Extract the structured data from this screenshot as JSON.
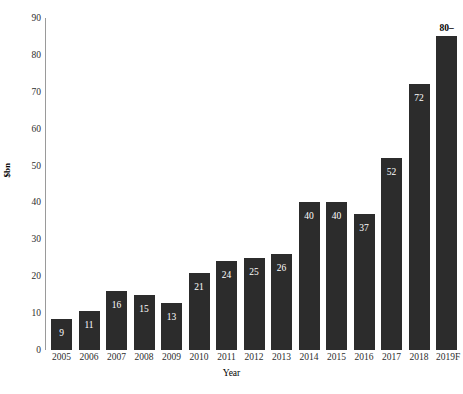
{
  "chart_data": {
    "type": "bar",
    "title": "",
    "xlabel": "Year",
    "ylabel": "$bn",
    "categories": [
      "2005",
      "2006",
      "2007",
      "2008",
      "2009",
      "2010",
      "2011",
      "2012",
      "2013",
      "2014",
      "2015",
      "2016",
      "2017",
      "2018",
      "2019F"
    ],
    "values": [
      8.5,
      10.5,
      16,
      15,
      12.7,
      21,
      24,
      25,
      26,
      40,
      40,
      37,
      52,
      72,
      85
    ],
    "labels": [
      "9",
      "11",
      "16",
      "15",
      "13",
      "21",
      "24",
      "25",
      "26",
      "40",
      "40",
      "37",
      "52",
      "72",
      "80–"
    ],
    "label_positions": [
      "inside",
      "inside",
      "inside",
      "inside",
      "inside",
      "inside",
      "inside",
      "inside",
      "inside",
      "inside",
      "inside",
      "inside",
      "inside",
      "inside",
      "above"
    ],
    "ylim": [
      0,
      90
    ],
    "yticks": [
      0,
      10,
      20,
      30,
      40,
      50,
      60,
      70,
      80,
      90
    ],
    "ytick_labels": [
      "0",
      "10",
      "20",
      "30",
      "40",
      "50",
      "60",
      "70",
      "80",
      "90"
    ],
    "grid": false,
    "legend": null,
    "bar_color": "#2c2c2c",
    "inside_label_color": "#ffffff",
    "above_label_color": "#000000",
    "axis_color": "#9a9a9a",
    "background": "#ffffff"
  }
}
